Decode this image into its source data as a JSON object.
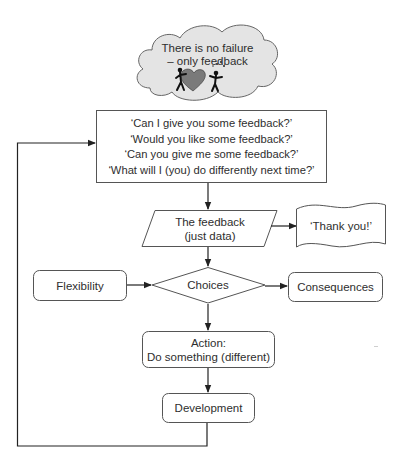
{
  "diagram": {
    "type": "flowchart",
    "colors": {
      "stroke": "#555555",
      "arrow": "#222222",
      "cloud_fill": "#e4e4e4",
      "text": "#2e2e2e",
      "background": "#ffffff"
    },
    "cloud": {
      "line1": "There is no failure",
      "line2": "– only feedback",
      "illustration": "two-stick-figures-with-heart-icon"
    },
    "questions_box": {
      "lines": [
        "‘Can I give you some feedback?’",
        "‘Would you like some feedback?’",
        "‘Can you give me some feedback?’",
        "‘What will I (you) do differently next time?’"
      ]
    },
    "feedback_node": {
      "shape": "parallelogram",
      "line1": "The feedback",
      "line2": "(just data)"
    },
    "thank_you_node": {
      "shape": "document-wave",
      "label": "‘Thank you!’"
    },
    "choices_node": {
      "shape": "diamond",
      "label": "Choices"
    },
    "flexibility_node": {
      "shape": "rounded-rect",
      "label": "Flexibility"
    },
    "consequences_node": {
      "shape": "rounded-rect",
      "label": "Consequences"
    },
    "action_node": {
      "shape": "rounded-rect",
      "line1": "Action:",
      "line2": "Do something (different)"
    },
    "development_node": {
      "shape": "rounded-rect",
      "label": "Development"
    },
    "edges": [
      {
        "from": "questions_box",
        "to": "feedback_node"
      },
      {
        "from": "feedback_node",
        "to": "thank_you_node"
      },
      {
        "from": "feedback_node",
        "to": "choices_node"
      },
      {
        "from": "flexibility_node",
        "to": "choices_node"
      },
      {
        "from": "choices_node",
        "to": "consequences_node"
      },
      {
        "from": "choices_node",
        "to": "action_node"
      },
      {
        "from": "action_node",
        "to": "development_node"
      },
      {
        "from": "development_node",
        "to": "questions_box",
        "style": "loop-back-left"
      }
    ]
  }
}
